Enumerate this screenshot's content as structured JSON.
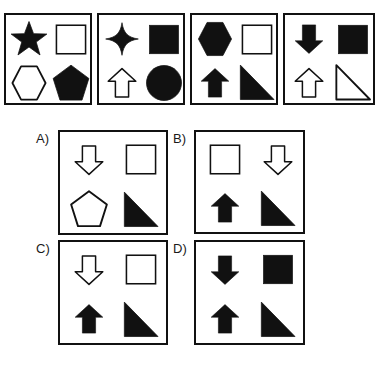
{
  "puzzle": {
    "type": "visual-analogy-matrix",
    "sequence": {
      "name": "sequence-row",
      "panels": [
        {
          "id": "seq-1",
          "shapes": [
            {
              "slot": "top-left",
              "shape": "star5",
              "fill": "black"
            },
            {
              "slot": "top-right",
              "shape": "rectangle",
              "fill": "white"
            },
            {
              "slot": "bottom-left",
              "shape": "hexagon",
              "fill": "white"
            },
            {
              "slot": "bottom-right",
              "shape": "pentagon",
              "fill": "black"
            }
          ]
        },
        {
          "id": "seq-2",
          "shapes": [
            {
              "slot": "top-left",
              "shape": "star4",
              "fill": "black"
            },
            {
              "slot": "top-right",
              "shape": "rectangle",
              "fill": "black"
            },
            {
              "slot": "bottom-left",
              "shape": "arrow-up",
              "fill": "white"
            },
            {
              "slot": "bottom-right",
              "shape": "circle",
              "fill": "black"
            }
          ]
        },
        {
          "id": "seq-3",
          "shapes": [
            {
              "slot": "top-left",
              "shape": "hexagon",
              "fill": "black"
            },
            {
              "slot": "top-right",
              "shape": "rectangle",
              "fill": "white"
            },
            {
              "slot": "bottom-left",
              "shape": "arrow-up",
              "fill": "black"
            },
            {
              "slot": "bottom-right",
              "shape": "triangle",
              "fill": "black"
            }
          ]
        },
        {
          "id": "seq-4",
          "shapes": [
            {
              "slot": "top-left",
              "shape": "arrow-down",
              "fill": "black"
            },
            {
              "slot": "top-right",
              "shape": "rectangle",
              "fill": "black"
            },
            {
              "slot": "bottom-left",
              "shape": "arrow-up",
              "fill": "white"
            },
            {
              "slot": "bottom-right",
              "shape": "triangle",
              "fill": "white"
            }
          ]
        }
      ]
    },
    "options": [
      {
        "id": "option-a",
        "label": "A)",
        "shapes": [
          {
            "slot": "top-left",
            "shape": "arrow-down",
            "fill": "white"
          },
          {
            "slot": "top-right",
            "shape": "rectangle",
            "fill": "white"
          },
          {
            "slot": "bottom-left",
            "shape": "pentagon",
            "fill": "white"
          },
          {
            "slot": "bottom-right",
            "shape": "triangle",
            "fill": "black"
          }
        ]
      },
      {
        "id": "option-b",
        "label": "B)",
        "shapes": [
          {
            "slot": "top-left",
            "shape": "rectangle",
            "fill": "white"
          },
          {
            "slot": "top-right",
            "shape": "arrow-down",
            "fill": "white"
          },
          {
            "slot": "bottom-left",
            "shape": "arrow-up",
            "fill": "black"
          },
          {
            "slot": "bottom-right",
            "shape": "triangle",
            "fill": "black"
          }
        ]
      },
      {
        "id": "option-c",
        "label": "C)",
        "shapes": [
          {
            "slot": "top-left",
            "shape": "arrow-down",
            "fill": "white"
          },
          {
            "slot": "top-right",
            "shape": "rectangle",
            "fill": "white"
          },
          {
            "slot": "bottom-left",
            "shape": "arrow-up",
            "fill": "black"
          },
          {
            "slot": "bottom-right",
            "shape": "triangle",
            "fill": "black"
          }
        ]
      },
      {
        "id": "option-d",
        "label": "D)",
        "shapes": [
          {
            "slot": "top-left",
            "shape": "arrow-down",
            "fill": "black"
          },
          {
            "slot": "top-right",
            "shape": "rectangle",
            "fill": "black"
          },
          {
            "slot": "bottom-left",
            "shape": "arrow-up",
            "fill": "black"
          },
          {
            "slot": "bottom-right",
            "shape": "triangle",
            "fill": "black"
          }
        ]
      }
    ],
    "colors": {
      "ink": "#111111",
      "paper": "#ffffff"
    }
  }
}
